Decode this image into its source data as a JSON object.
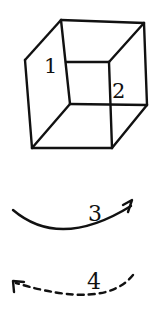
{
  "figure": {
    "stroke_color": "#111111",
    "background": "#ffffff",
    "cube": {
      "labels": [
        {
          "id": "1",
          "text": "1",
          "x": 45,
          "y": 73
        },
        {
          "id": "2",
          "text": "2",
          "x": 113,
          "y": 98
        }
      ]
    },
    "arrows": [
      {
        "id": "3",
        "label": "3",
        "style": "solid",
        "direction": "clockwise-right"
      },
      {
        "id": "4",
        "label": "4",
        "style": "dashed",
        "direction": "counterclockwise-left"
      }
    ]
  }
}
